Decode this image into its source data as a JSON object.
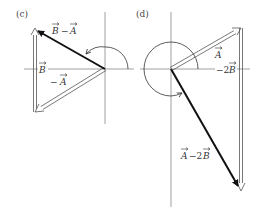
{
  "figure": {
    "panels": [
      {
        "id": "c",
        "label": "(c)",
        "origin": [
          105,
          69
        ],
        "vectors": [
          {
            "name": "B",
            "label": "B",
            "style": "double-line",
            "from": [
              35,
              112
            ],
            "to": [
              35,
              29
            ]
          },
          {
            "name": "-A",
            "label": "− A",
            "style": "double-line",
            "from": [
              105,
              69
            ],
            "to": [
              35,
              112
            ]
          },
          {
            "name": "B-A",
            "label": "B − A",
            "style": "thick",
            "from": [
              105,
              69
            ],
            "to": [
              35,
              29
            ]
          }
        ],
        "angle_arc": "semicircle-arrow"
      },
      {
        "id": "d",
        "label": "(d)",
        "origin": [
          171,
          69
        ],
        "vectors": [
          {
            "name": "A",
            "label": "A",
            "style": "double-line",
            "from": [
              171,
              69
            ],
            "to": [
              241,
              28
            ]
          },
          {
            "name": "-2B",
            "label": "−2B",
            "style": "double-line",
            "from": [
              241,
              28
            ],
            "to": [
              241,
              190
            ]
          },
          {
            "name": "A-2B",
            "label": "A − 2B",
            "style": "thick",
            "from": [
              171,
              69
            ],
            "to": [
              241,
              190
            ]
          }
        ],
        "angle_arc": "circle-arrow"
      }
    ],
    "labels": {
      "c_panel": "(c)",
      "d_panel": "(d)",
      "B_minus_A_B": "B",
      "B_minus_A_op": "−",
      "B_minus_A_A": "A",
      "B": "B",
      "neg_A_op": "−",
      "neg_A": "A",
      "A": "A",
      "neg_2B_coef": "−2",
      "neg_2B_B": "B",
      "A_minus_2B_A": "A",
      "A_minus_2B_op": "−2",
      "A_minus_2B_B": "B"
    },
    "colors": {
      "axis": "#777777",
      "vector": "#111111",
      "double_line": "#555555",
      "text": "#333333"
    }
  }
}
